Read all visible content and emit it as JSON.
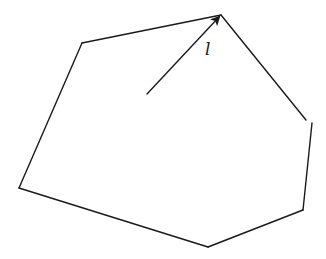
{
  "diagram": {
    "type": "geometry-figure",
    "stroke_color": "#1a1a1a",
    "background_color": "#ffffff",
    "vertices": [
      {
        "id": "top-apex",
        "x": 221,
        "y": 15
      },
      {
        "id": "top-left",
        "x": 82,
        "y": 43
      },
      {
        "id": "left",
        "x": 19,
        "y": 188
      },
      {
        "id": "bottom",
        "x": 208,
        "y": 247
      },
      {
        "id": "bottom-right",
        "x": 303,
        "y": 210
      },
      {
        "id": "right",
        "x": 312,
        "y": 123
      }
    ],
    "segments": [
      {
        "id": "edge-apex-to-topleft",
        "from": [
          221,
          15
        ],
        "to": [
          82,
          43
        ]
      },
      {
        "id": "edge-topleft-to-left",
        "from": [
          82,
          43
        ],
        "to": [
          19,
          188
        ]
      },
      {
        "id": "edge-left-to-bottom",
        "from": [
          19,
          188
        ],
        "to": [
          208,
          247
        ]
      },
      {
        "id": "edge-bottom-to-bottomright",
        "from": [
          208,
          247
        ],
        "to": [
          303,
          210
        ]
      },
      {
        "id": "edge-bottomright-to-right",
        "from": [
          303,
          210
        ],
        "to": [
          312,
          123
        ]
      },
      {
        "id": "edge-apex-to-right",
        "from": [
          221,
          15
        ],
        "to": [
          306,
          120
        ]
      }
    ],
    "arrow": {
      "label": "l",
      "from": [
        147,
        94
      ],
      "to": [
        221,
        15
      ]
    },
    "label_position": {
      "x": 205,
      "y": 55
    }
  }
}
